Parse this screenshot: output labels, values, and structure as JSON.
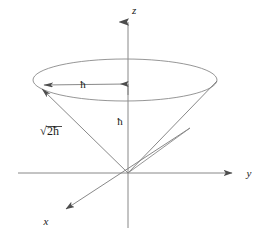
{
  "figure": {
    "name": "angular-momentum-cone",
    "background_color": "#ffffff",
    "line_color": "#6b6b6b",
    "dark_line_color": "#5a5a5a",
    "text_color": "#1a1a1a"
  },
  "axes": {
    "z": {
      "label": "z",
      "label_x": 132,
      "label_y": 14,
      "arrow": "up",
      "x": 128,
      "y_top": 18,
      "y_bottom": 228
    },
    "y": {
      "label": "y",
      "label_x": 249,
      "label_y": 177,
      "arrow": "right",
      "y": 173,
      "x_left": 18,
      "x_right": 237
    },
    "x": {
      "label": "x",
      "label_x": 46,
      "label_y": 225,
      "arrow": "down-left",
      "x_end": 62,
      "y_end": 212,
      "x_start": 190,
      "y_start": 128
    }
  },
  "cone": {
    "apex_x": 128,
    "apex_y": 173,
    "rim_center_x": 125,
    "rim_center_y": 80,
    "rim_radius_x": 92,
    "rim_radius_y": 21
  },
  "labels": {
    "radius": "ħ",
    "radius_x": 83,
    "radius_y": 88,
    "height": "ħ",
    "height_x": 117,
    "height_y": 124,
    "slant_prefix": "√",
    "slant_main": "2ħ",
    "slant_full": "√2ħ",
    "slant_x": 52,
    "slant_y": 134
  },
  "annotations": {
    "radius_arrow": {
      "from_x": 126,
      "from_y": 84,
      "to_x": 40,
      "to_y": 85,
      "description": "horizontal radius arrow labelled h-bar"
    },
    "height_arrow": {
      "x": 128,
      "from_y": 96,
      "to_y": 80,
      "description": "short vertical arrow on z axis labelled h-bar"
    },
    "slant_arrow": {
      "from_x": 128,
      "from_y": 173,
      "to_x": 37,
      "to_y": 86,
      "description": "slant line from apex to left rim labelled sqrt 2 h-bar"
    },
    "extra_ray": {
      "from_x": 128,
      "from_y": 173,
      "to_x": 190,
      "to_y": 128,
      "description": "short ray from origin toward viewer"
    }
  }
}
